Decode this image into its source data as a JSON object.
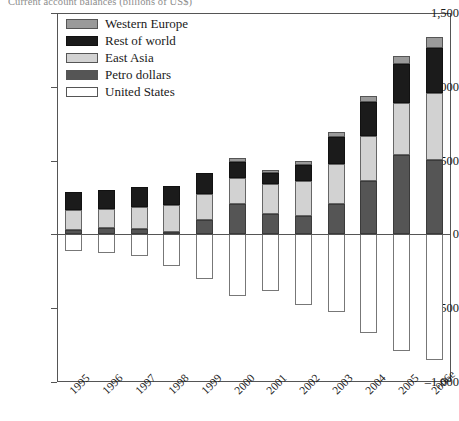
{
  "chart_data": {
    "type": "bar",
    "subtype": "stacked-bar-with-negative",
    "title": "Current account balances (billions of US$)",
    "xlabel": "",
    "ylabel": "",
    "ylim": [
      -1000,
      1500
    ],
    "yticks": [
      -1000,
      -500,
      0,
      500,
      1000,
      1500
    ],
    "ytick_labels": [
      "–1,000",
      "–500",
      "0",
      "500",
      "1,000",
      "1,500"
    ],
    "grid": false,
    "legend_position": "top-left",
    "categories": [
      "1995",
      "1996",
      "1997",
      "1998",
      "1999",
      "2000",
      "2001",
      "2002",
      "2003",
      "2004",
      "2005",
      "2006e"
    ],
    "series": [
      {
        "name": "Western Europe",
        "color": "#9a9a9a",
        "values": [
          0,
          0,
          0,
          0,
          0,
          25,
          20,
          30,
          35,
          45,
          55,
          75
        ]
      },
      {
        "name": "Rest of world",
        "color": "#1b1b1b",
        "values": [
          120,
          125,
          135,
          130,
          140,
          105,
          75,
          105,
          185,
          230,
          265,
          300
        ]
      },
      {
        "name": "East Asia",
        "color": "#d2d2d2",
        "values": [
          135,
          130,
          150,
          185,
          180,
          180,
          200,
          240,
          270,
          300,
          350,
          455
        ]
      },
      {
        "name": "Petro dollars",
        "color": "#555555",
        "values": [
          30,
          45,
          35,
          15,
          95,
          205,
          140,
          125,
          205,
          365,
          540,
          505
        ]
      },
      {
        "name": "United States",
        "color": "#ffffff",
        "values": [
          -115,
          -125,
          -145,
          -215,
          -300,
          -415,
          -385,
          -475,
          -525,
          -665,
          -790,
          -850
        ]
      }
    ],
    "totals_positive": [
      285,
      300,
      320,
      330,
      415,
      515,
      435,
      500,
      695,
      940,
      1210,
      1335
    ]
  },
  "legend": {
    "items": [
      {
        "label": "Western Europe",
        "swatch": "we"
      },
      {
        "label": "Rest of world",
        "swatch": "row"
      },
      {
        "label": "East Asia",
        "swatch": "ea"
      },
      {
        "label": "Petro dollars",
        "swatch": "pd"
      },
      {
        "label": "United States",
        "swatch": "us"
      }
    ]
  }
}
